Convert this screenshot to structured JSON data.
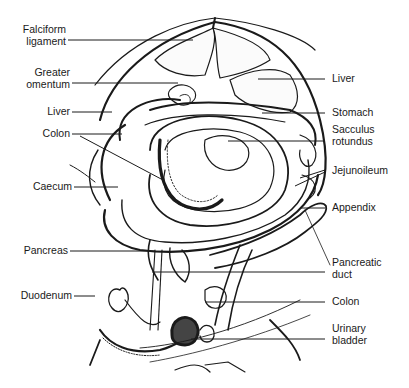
{
  "diagram": {
    "type": "anatomical-illustration",
    "labels_left": [
      {
        "id": "falciform-ligament",
        "text": "Falciform\nligament"
      },
      {
        "id": "greater-omentum",
        "text": "Greater\nomentum"
      },
      {
        "id": "liver-left",
        "text": "Liver"
      },
      {
        "id": "colon-left",
        "text": "Colon"
      },
      {
        "id": "caecum",
        "text": "Caecum"
      },
      {
        "id": "pancreas",
        "text": "Pancreas"
      },
      {
        "id": "duodenum",
        "text": "Duodenum"
      }
    ],
    "labels_right": [
      {
        "id": "liver-right",
        "text": "Liver"
      },
      {
        "id": "stomach",
        "text": "Stomach"
      },
      {
        "id": "sacculus-rotundus",
        "text": "Sacculus\nrotundus"
      },
      {
        "id": "jejunoileum",
        "text": "Jejunoileum"
      },
      {
        "id": "appendix",
        "text": "Appendix"
      },
      {
        "id": "pancreatic-duct",
        "text": "Pancreatic\nduct"
      },
      {
        "id": "colon-right",
        "text": "Colon"
      },
      {
        "id": "urinary-bladder",
        "text": "Urinary\nbladder"
      }
    ]
  }
}
